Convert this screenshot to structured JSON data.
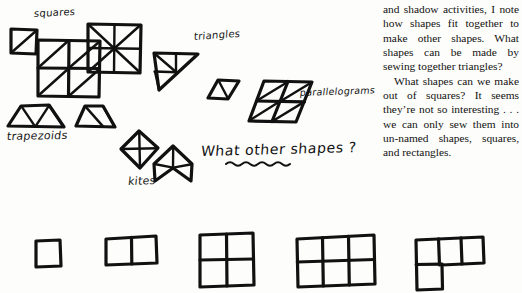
{
  "page": {
    "width": 522,
    "height": 293,
    "ink_color": "#111111",
    "background_color": "#fdfdfb"
  },
  "handwritten_labels": {
    "squares": "squares",
    "triangles": "triangles",
    "parallelograms": "parallelograms",
    "trapezoids": "trapezoids",
    "kites": "kites"
  },
  "handwritten_question": {
    "part_underlined_prefix": "What ",
    "part_underlined": "other",
    "part_suffix": " shapes ?",
    "full_text": "What other shapes ?",
    "underline_style": "wavy"
  },
  "printed_text": {
    "paragraph_1": "and shadow activities, I note how shapes fit together to make other shapes. What shapes can be made by sewing together triangles?",
    "paragraph_2": "What shapes can we make out of squares? It seems they’re not so interesting . . . we can only sew them into un-named shapes, squares, and rectangles."
  },
  "figures": {
    "squares_group": [
      {
        "name": "square-single-diagonal",
        "cells": 1,
        "subdivision": "one diagonal"
      },
      {
        "name": "square-2x2-diagonals",
        "cells": 4,
        "subdivision": "each cell one diagonal"
      },
      {
        "name": "square-eight-triangles",
        "cells": 1,
        "subdivision": "two diagonals plus vertical and horizontal medians"
      }
    ],
    "triangles_group": [
      {
        "name": "triangle-subdivided-large",
        "subdivision": "right triangle split into smaller triangles"
      },
      {
        "name": "triangle-pair-small",
        "subdivision": "two small triangles forming a parallelogram"
      }
    ],
    "parallelogram_group": [
      {
        "name": "parallelogram-subdivided",
        "subdivision": "four cells with diagonals"
      }
    ],
    "trapezoids_group": [
      {
        "name": "trapezoid-wide",
        "subdivision": "four triangles"
      },
      {
        "name": "trapezoid-narrow",
        "subdivision": "three triangles"
      }
    ],
    "kites_group": [
      {
        "name": "kite-diamond",
        "subdivision": "horizontal and vertical medians"
      },
      {
        "name": "kite-dart",
        "subdivision": "concave dart with medians"
      }
    ],
    "bottom_row": [
      {
        "name": "polyomino-1x1",
        "label": "1 square",
        "grid": "1 wide, 1 tall"
      },
      {
        "name": "polyomino-2x1",
        "label": "2 squares",
        "grid": "2 wide, 1 tall"
      },
      {
        "name": "polyomino-2x2",
        "label": "4 squares",
        "grid": "2 wide, 2 tall"
      },
      {
        "name": "polyomino-3x2",
        "label": "6 squares",
        "grid": "3 wide, 2 tall"
      },
      {
        "name": "polyomino-L-shape",
        "label": "4 squares L",
        "grid": "3 wide top row plus 1 below left"
      }
    ]
  }
}
